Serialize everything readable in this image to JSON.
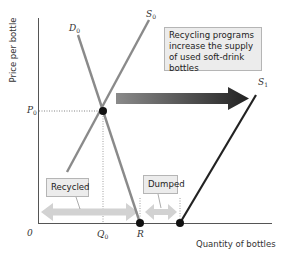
{
  "diagram": {
    "axes": {
      "y_label": "Price per bottle",
      "x_label": "Quantity of bottles",
      "origin_label": "0"
    },
    "curves": {
      "demand": {
        "name": "D",
        "subscript": "0"
      },
      "supply_initial": {
        "name": "S",
        "subscript": "0"
      },
      "supply_new": {
        "name": "S",
        "subscript": "1"
      }
    },
    "ticks": {
      "price": {
        "name": "P",
        "subscript": "0"
      },
      "quantity": {
        "name": "Q",
        "subscript": "0"
      },
      "r_point": "R"
    },
    "callouts": {
      "main": "Recycling programs increase the supply of used soft-drink bottles",
      "recycled": "Recycled",
      "dumped": "Dumped"
    },
    "colors": {
      "axis": "#555555",
      "initial_curves": "#8a8a8a",
      "new_supply": "#222222",
      "shift_arrow_start": "#8a8a8a",
      "shift_arrow_end": "#222222",
      "range_arrows": "#d2d2d2",
      "callout_fill": "#ececec",
      "callout_border": "#b5b5b5"
    }
  }
}
